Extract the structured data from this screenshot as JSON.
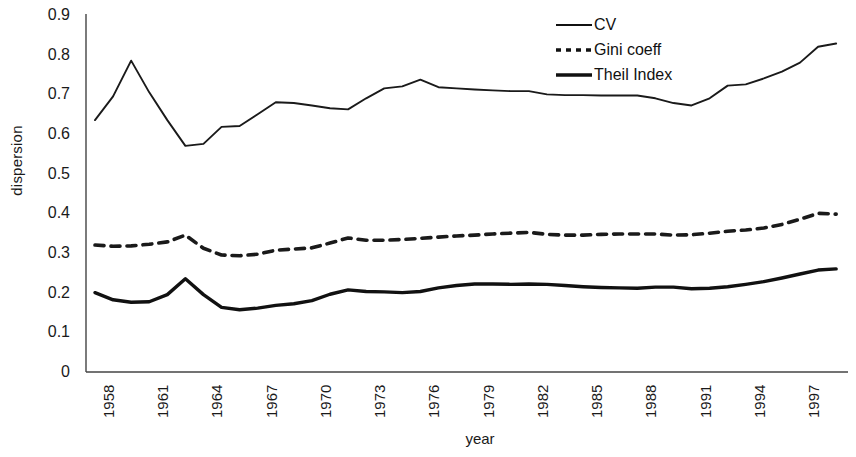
{
  "chart_data": {
    "type": "line",
    "title": "",
    "xlabel": "year",
    "ylabel": "dispersion",
    "xlim": [
      1958,
      1999
    ],
    "ylim": [
      0,
      0.9
    ],
    "grid": false,
    "legend_position": "top-right",
    "y_ticks": [
      "0",
      "0.1",
      "0.2",
      "0.3",
      "0.4",
      "0.5",
      "0.6",
      "0.7",
      "0.8",
      "0.9"
    ],
    "y_tick_values": [
      0,
      0.1,
      0.2,
      0.3,
      0.4,
      0.5,
      0.6,
      0.7,
      0.8,
      0.9
    ],
    "x_ticks": [
      "1958",
      "1961",
      "1964",
      "1967",
      "1970",
      "1973",
      "1976",
      "1979",
      "1982",
      "1985",
      "1988",
      "1991",
      "1994",
      "1997"
    ],
    "x_tick_values": [
      1958,
      1961,
      1964,
      1967,
      1970,
      1973,
      1976,
      1979,
      1982,
      1985,
      1988,
      1991,
      1994,
      1997
    ],
    "x": [
      1958,
      1959,
      1960,
      1961,
      1962,
      1963,
      1964,
      1965,
      1966,
      1967,
      1968,
      1969,
      1970,
      1971,
      1972,
      1973,
      1974,
      1975,
      1976,
      1977,
      1978,
      1979,
      1980,
      1981,
      1982,
      1983,
      1984,
      1985,
      1986,
      1987,
      1988,
      1989,
      1990,
      1991,
      1992,
      1993,
      1994,
      1995,
      1996,
      1997,
      1998,
      1999
    ],
    "series": [
      {
        "name": "CV",
        "style": "solid-thin",
        "color": "#1a1a1a",
        "values": [
          0.635,
          0.695,
          0.785,
          0.705,
          0.635,
          0.57,
          0.575,
          0.618,
          0.62,
          0.65,
          0.68,
          0.678,
          0.672,
          0.665,
          0.662,
          0.69,
          0.715,
          0.72,
          0.737,
          0.718,
          0.715,
          0.712,
          0.71,
          0.708,
          0.708,
          0.7,
          0.698,
          0.698,
          0.697,
          0.697,
          0.697,
          0.69,
          0.678,
          0.672,
          0.69,
          0.722,
          0.725,
          0.74,
          0.757,
          0.78,
          0.82,
          0.828
        ]
      },
      {
        "name": "Gini coeff",
        "style": "dashed",
        "color": "#1a1a1a",
        "values": [
          0.32,
          0.317,
          0.318,
          0.322,
          0.328,
          0.345,
          0.312,
          0.295,
          0.293,
          0.297,
          0.307,
          0.31,
          0.313,
          0.325,
          0.338,
          0.332,
          0.332,
          0.334,
          0.337,
          0.34,
          0.343,
          0.345,
          0.348,
          0.35,
          0.352,
          0.347,
          0.345,
          0.345,
          0.347,
          0.348,
          0.348,
          0.348,
          0.345,
          0.346,
          0.35,
          0.355,
          0.358,
          0.363,
          0.372,
          0.385,
          0.4,
          0.398
        ]
      },
      {
        "name": "Theil Index",
        "style": "solid-thick",
        "color": "#111111",
        "values": [
          0.2,
          0.182,
          0.176,
          0.177,
          0.195,
          0.235,
          0.195,
          0.163,
          0.157,
          0.161,
          0.168,
          0.172,
          0.18,
          0.196,
          0.207,
          0.203,
          0.202,
          0.2,
          0.203,
          0.212,
          0.218,
          0.222,
          0.222,
          0.221,
          0.222,
          0.221,
          0.218,
          0.215,
          0.213,
          0.212,
          0.211,
          0.214,
          0.214,
          0.21,
          0.211,
          0.215,
          0.221,
          0.228,
          0.237,
          0.247,
          0.257,
          0.26
        ]
      }
    ]
  },
  "legend": {
    "items": [
      {
        "label": "CV",
        "style": "solid-thin"
      },
      {
        "label": "Gini coeff",
        "style": "dashed"
      },
      {
        "label": "Theil Index",
        "style": "solid-thick"
      }
    ]
  }
}
